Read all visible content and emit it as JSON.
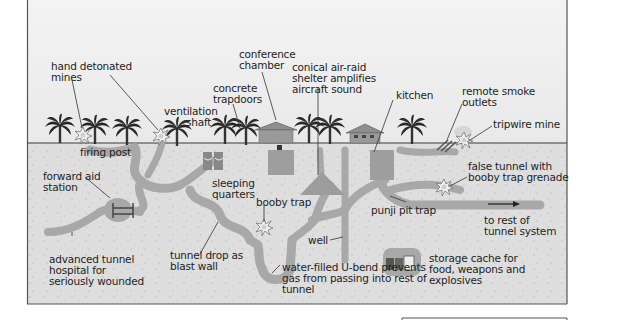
{
  "diagram": {
    "type": "cross-section illustration",
    "colors": {
      "sky": "#ececec",
      "soil": "#dcdcdc",
      "tunnel": "#a9a9a9",
      "frame": "#555555",
      "text": "#1e1e1e"
    },
    "labels": {
      "hand_detonated_mines": "hand detonated\nmines",
      "firing_post": "firing post",
      "ventilation_shaft": "ventilation\n       shaft",
      "concrete_trapdoors": "concrete\ntrapdoors",
      "conference_chamber": "conference\nchamber",
      "air_raid_shelter": "conical air-raid\nshelter amplifies\naircraft sound",
      "kitchen": "kitchen",
      "remote_smoke_outlets": "remote smoke\noutlets",
      "tripwire_mine": "tripwire mine",
      "forward_aid_station": "forward aid\nstation",
      "sleeping_quarters": "sleeping\nquarters",
      "booby_trap": "booby trap",
      "false_tunnel": "false tunnel with\nbooby trap grenade",
      "punji_pit_trap": "punji pit trap",
      "to_rest_of_tunnel": "to rest of\ntunnel system",
      "well": "well",
      "advanced_tunnel_hospital": "advanced tunnel\nhospital for\nseriously wounded",
      "tunnel_drop": "tunnel drop as\nblast wall",
      "water_filled_u_bend": "water-filled U-bend prevents\ngas from passing into rest of\ntunnel",
      "storage_cache": "storage cache for\nfood, weapons and\nexplosives"
    }
  }
}
